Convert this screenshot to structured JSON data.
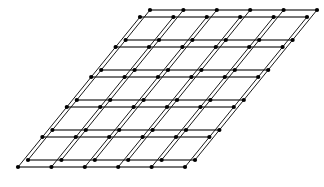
{
  "figure": {
    "title": "Two-dimensional double lattice diagram",
    "background_color": "#ffffff"
  },
  "canvas": {
    "width": 324,
    "height": 187
  },
  "style": {
    "horizontal_line_color": "#4a4a4a",
    "horizontal_line_width": 1.6,
    "diagonal_line_color": "#1a1a1a",
    "diagonal_line_width": 1.0,
    "node_color": "#000000",
    "node_radius": 2.1
  },
  "chart_data": {
    "type": "scatter",
    "title": "",
    "xlabel": "",
    "ylabel": "",
    "grid": true,
    "legend": "none",
    "xlim": [
      0,
      324
    ],
    "ylim": [
      187,
      0
    ],
    "lattices": [
      {
        "name": "lattice-a",
        "origin": [
          18,
          167
        ],
        "basis_vector_a": [
          33.4,
          0
        ],
        "basis_vector_b": [
          24.4,
          -30.0
        ],
        "counts": {
          "a": 5,
          "b": 5
        },
        "corners": {
          "bottom_left": [
            18,
            167
          ],
          "bottom_right": [
            185,
            167
          ],
          "top_left": [
            140,
            17
          ],
          "top_right": [
            307,
            17
          ]
        }
      },
      {
        "name": "lattice-b",
        "origin": [
          28,
          160
        ],
        "basis_vector_a": [
          33.4,
          0
        ],
        "basis_vector_b": [
          24.4,
          -30.0
        ],
        "counts": {
          "a": 5,
          "b": 5
        },
        "offset_from_lattice_a": [
          10,
          -7
        ],
        "corners": {
          "bottom_left": [
            28,
            160
          ],
          "bottom_right": [
            195,
            160
          ],
          "top_left": [
            150,
            10
          ],
          "top_right": [
            317,
            10
          ]
        }
      }
    ]
  }
}
